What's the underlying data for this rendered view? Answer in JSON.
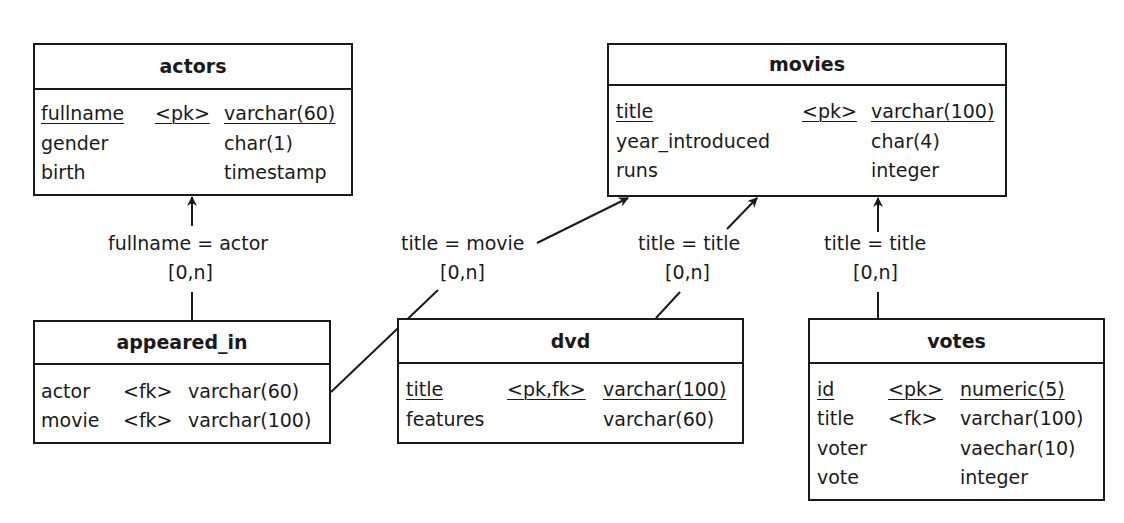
{
  "entities": {
    "actors": {
      "name": "actors",
      "columns": [
        {
          "name": "fullname",
          "key": "<pk>",
          "type": "varchar(60)",
          "primary": true
        },
        {
          "name": "gender",
          "key": "",
          "type": "char(1)",
          "primary": false
        },
        {
          "name": "birth",
          "key": "",
          "type": "timestamp",
          "primary": false
        }
      ]
    },
    "movies": {
      "name": "movies",
      "columns": [
        {
          "name": "title",
          "key": "<pk>",
          "type": "varchar(100)",
          "primary": true
        },
        {
          "name": "year_introduced",
          "key": "",
          "type": "char(4)",
          "primary": false
        },
        {
          "name": "runs",
          "key": "",
          "type": "integer",
          "primary": false
        }
      ]
    },
    "appeared_in": {
      "name": "appeared_in",
      "columns": [
        {
          "name": "actor",
          "key": "<fk>",
          "type": "varchar(60)",
          "primary": false
        },
        {
          "name": "movie",
          "key": "<fk>",
          "type": "varchar(100)",
          "primary": false
        }
      ]
    },
    "dvd": {
      "name": "dvd",
      "columns": [
        {
          "name": "title",
          "key": "<pk,fk>",
          "type": "varchar(100)",
          "primary": true
        },
        {
          "name": "features",
          "key": "",
          "type": "varchar(60)",
          "primary": false
        }
      ]
    },
    "votes": {
      "name": "votes",
      "columns": [
        {
          "name": "id",
          "key": "<pk>",
          "type": "numeric(5)",
          "primary": true
        },
        {
          "name": "title",
          "key": "<fk>",
          "type": "varchar(100)",
          "primary": false
        },
        {
          "name": "voter",
          "key": "",
          "type": "vaechar(10)",
          "primary": false
        },
        {
          "name": "vote",
          "key": "",
          "type": "integer",
          "primary": false
        }
      ]
    }
  },
  "relationships": [
    {
      "from": "appeared_in",
      "to": "actors",
      "join": "fullname = actor",
      "cardinality": "[0,n]"
    },
    {
      "from": "appeared_in",
      "to": "movies",
      "join": "title = movie",
      "cardinality": "[0,n]"
    },
    {
      "from": "dvd",
      "to": "movies",
      "join": "title = title",
      "cardinality": "[0,n]"
    },
    {
      "from": "votes",
      "to": "movies",
      "join": "title = title",
      "cardinality": "[0,n]"
    }
  ]
}
